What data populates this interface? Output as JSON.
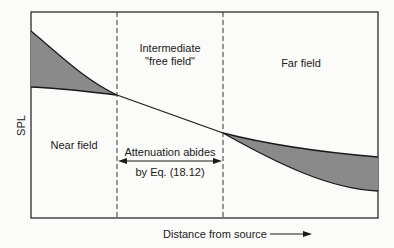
{
  "diagram": {
    "y_axis_label": "SPL",
    "x_axis_label": "Distance from source",
    "regions": {
      "near_field": "Near field",
      "intermediate_line1": "Intermediate",
      "intermediate_line2": "\"free field\"",
      "far_field": "Far field"
    },
    "annotation": {
      "line1": "Attenuation abides",
      "line2": "by Eq. (18.12)"
    },
    "colors": {
      "shade": "#8a8a8a",
      "line": "#1a1a1a",
      "background": "#fbfbf9"
    }
  }
}
